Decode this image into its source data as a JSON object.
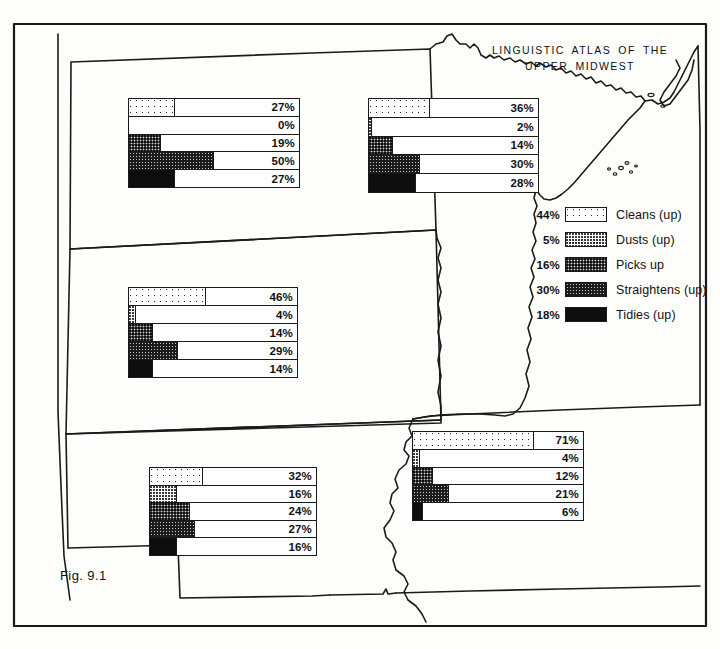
{
  "title": {
    "line1": "LINGUISTIC ATLAS OF THE",
    "line2": "UPPER MIDWEST"
  },
  "figure_label": "Fig. 9.1",
  "colors": {
    "ink": "#1a1a1a",
    "paper": "#fdfdfb"
  },
  "legend": {
    "items": [
      {
        "pct": "44%",
        "label": "Cleans (up)",
        "pattern": "pat-cleans",
        "icon": "swatch-cleans"
      },
      {
        "pct": "5%",
        "label": "Dusts (up)",
        "pattern": "pat-dusts",
        "icon": "swatch-dusts"
      },
      {
        "pct": "16%",
        "label": "Picks up",
        "pattern": "pat-picks",
        "icon": "swatch-picks"
      },
      {
        "pct": "30%",
        "label": "Straightens (up)",
        "pattern": "pat-straightens",
        "icon": "swatch-straightens"
      },
      {
        "pct": "18%",
        "label": "Tidies (up)",
        "pattern": "pat-tidies",
        "icon": "swatch-tidies"
      }
    ]
  },
  "chart_data": {
    "type": "bar",
    "title": "LINGUISTIC ATLAS OF THE UPPER MIDWEST",
    "xlabel": "",
    "ylabel": "",
    "xlim": [
      0,
      100
    ],
    "grid": false,
    "legend_position": "right",
    "categories": [
      "Cleans (up)",
      "Dusts (up)",
      "Picks up",
      "Straightens (up)",
      "Tidies (up)"
    ],
    "overall_values": [
      44,
      5,
      16,
      30,
      18
    ],
    "panels": [
      {
        "region": "North Dakota",
        "panel_id": "panel-north-dakota",
        "left": 128,
        "top": 98,
        "width": 172,
        "height": 90,
        "values": [
          27,
          0,
          19,
          50,
          27
        ],
        "labels": [
          "27%",
          "0%",
          "19%",
          "50%",
          "27%"
        ]
      },
      {
        "region": "Minnesota",
        "panel_id": "panel-minnesota",
        "left": 368,
        "top": 98,
        "width": 171,
        "height": 95,
        "values": [
          36,
          2,
          14,
          30,
          28
        ],
        "labels": [
          "36%",
          "2%",
          "14%",
          "30%",
          "28%"
        ]
      },
      {
        "region": "South Dakota",
        "panel_id": "panel-south-dakota",
        "left": 128,
        "top": 287,
        "width": 170,
        "height": 91,
        "values": [
          46,
          4,
          14,
          29,
          14
        ],
        "labels": [
          "46%",
          "4%",
          "14%",
          "29%",
          "14%"
        ]
      },
      {
        "region": "Iowa",
        "panel_id": "panel-iowa",
        "left": 412,
        "top": 431,
        "width": 172,
        "height": 90,
        "values": [
          71,
          4,
          12,
          21,
          6
        ],
        "labels": [
          "71%",
          "4%",
          "12%",
          "21%",
          "6%"
        ]
      },
      {
        "region": "Nebraska",
        "panel_id": "panel-nebraska",
        "left": 149,
        "top": 467,
        "width": 168,
        "height": 89,
        "values": [
          32,
          16,
          24,
          27,
          16
        ],
        "labels": [
          "32%",
          "16%",
          "24%",
          "27%",
          "16%"
        ]
      }
    ]
  }
}
